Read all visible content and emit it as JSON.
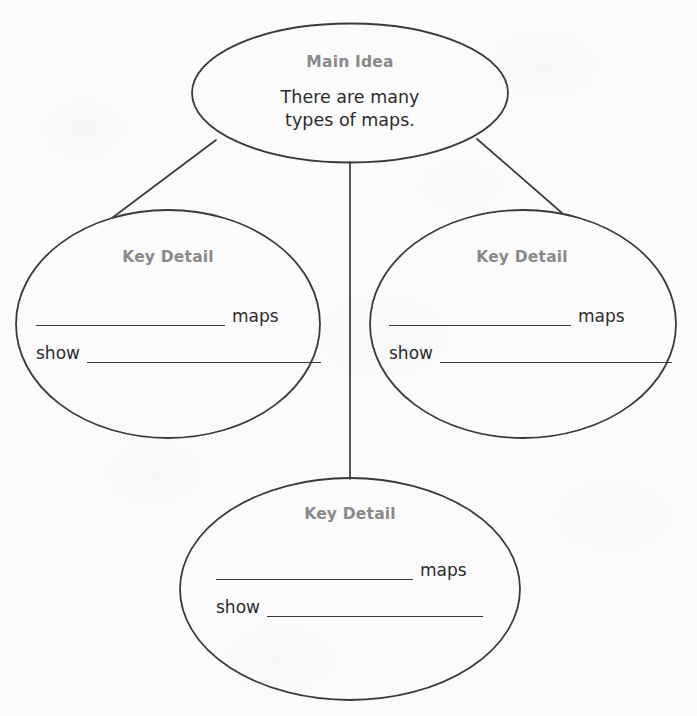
{
  "worksheet": {
    "type": "graphic-organizer",
    "structure": "main-idea-and-key-details-web",
    "background_color": "#fbfbfb",
    "stroke_color": "#3a3a3a",
    "heading_color": "#8a8a8a",
    "body_text_color": "#2b2b2b"
  },
  "main_idea": {
    "heading": "Main Idea",
    "body_line1": "There are many",
    "body_line2": "types of maps."
  },
  "key_details": [
    {
      "heading": "Key Detail",
      "line1_blank_label": "",
      "line1_word": "maps",
      "line2_word": "show",
      "line2_blank_label": ""
    },
    {
      "heading": "Key Detail",
      "line1_blank_label": "",
      "line1_word": "maps",
      "line2_word": "show",
      "line2_blank_label": ""
    },
    {
      "heading": "Key Detail",
      "line1_blank_label": "",
      "line1_word": "maps",
      "line2_word": "show",
      "line2_blank_label": ""
    }
  ]
}
